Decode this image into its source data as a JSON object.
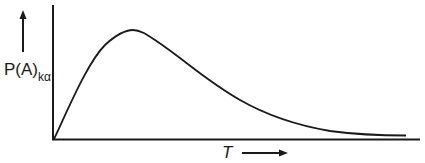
{
  "figure": {
    "type": "schematic-curve",
    "y_axis_label": "P(A)",
    "y_axis_label_subscript": "kα",
    "x_axis_label": "T",
    "line_color": "#1a1a1a",
    "background": "#ffffff"
  },
  "curve": {
    "description": "Rises linearly from origin, peaks early, then decays with a long tail toward zero",
    "shape": "skewed unimodal"
  }
}
